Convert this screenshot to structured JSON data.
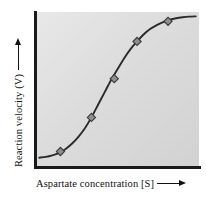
{
  "figure": {
    "background_color": "#ffffff",
    "plot_background_color": "#dcdcdc",
    "axis_color": "#111111",
    "curve_color": "#2b2b2b",
    "marker_fill_color": "#8e8e8e",
    "marker_stroke_color": "#3a3a3a"
  },
  "axes": {
    "x": {
      "label": "Aspartate concentration [S]",
      "arrow_icon": "arrow-right-icon"
    },
    "y": {
      "label": "Reaction velocity (V)",
      "arrow_icon": "arrow-up-icon"
    }
  },
  "chart_data": {
    "type": "line",
    "title": "",
    "subtitle": "",
    "xlabel": "Aspartate concentration [S]",
    "ylabel": "Reaction velocity (V)",
    "xlim": [
      0,
      100
    ],
    "ylim": [
      0,
      100
    ],
    "grid": false,
    "legend": null,
    "tick_labels": {
      "x": [],
      "y": []
    },
    "annotations": [],
    "series": [
      {
        "name": "Sigmoidal (cooperative) kinetics",
        "shape": "sigmoid",
        "line_style": "solid",
        "x": [
          2,
          6,
          10,
          14,
          18,
          22,
          26,
          30,
          34,
          38,
          42,
          46,
          50,
          54,
          58,
          62,
          66,
          70,
          74,
          78,
          82,
          86,
          90,
          94,
          98
        ],
        "y": [
          6,
          6.5,
          7.5,
          9,
          11.5,
          15,
          19.5,
          25,
          32,
          40,
          48,
          56,
          63,
          70,
          76,
          81,
          85.5,
          89,
          91.5,
          93.5,
          95,
          96,
          96.6,
          97,
          97.2
        ]
      }
    ],
    "markers": [
      {
        "label": "point-1",
        "x": 15,
        "y": 10
      },
      {
        "label": "point-2",
        "x": 34,
        "y": 32
      },
      {
        "label": "point-3",
        "x": 48,
        "y": 57
      },
      {
        "label": "point-4",
        "x": 62,
        "y": 81
      },
      {
        "label": "point-5",
        "x": 81,
        "y": 94
      }
    ]
  }
}
